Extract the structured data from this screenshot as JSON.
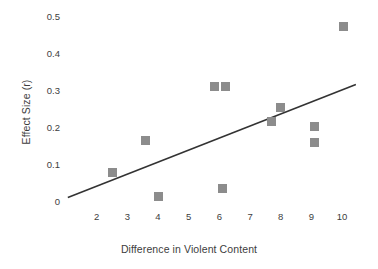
{
  "chart_data": {
    "type": "scatter",
    "title": "",
    "xlabel": "Difference in Violent Content",
    "ylabel": "Effect Size (r)",
    "xlim": [
      1.0,
      10.65
    ],
    "ylim": [
      -0.012,
      0.52
    ],
    "xticks": [
      2,
      3,
      4,
      5,
      6,
      7,
      8,
      9,
      10
    ],
    "xtick_labels": [
      "2",
      "3",
      "4",
      "5",
      "6",
      "7",
      "8",
      "9",
      "10"
    ],
    "yticks": [
      0,
      0.1,
      0.2,
      0.3,
      0.4,
      0.5
    ],
    "ytick_labels": [
      "0",
      "0.1",
      "0.2",
      "0.3",
      "0.4",
      "0.5"
    ],
    "grid": false,
    "legend": "none",
    "marker_shape": "square",
    "marker_color": "#8c8c8c",
    "marker_size_px": 9,
    "line_color": "#333333",
    "points": [
      {
        "x": 2.5,
        "y": 0.08
      },
      {
        "x": 3.6,
        "y": 0.165
      },
      {
        "x": 4.0,
        "y": 0.015
      },
      {
        "x": 5.85,
        "y": 0.312
      },
      {
        "x": 6.2,
        "y": 0.312
      },
      {
        "x": 6.1,
        "y": 0.035
      },
      {
        "x": 7.7,
        "y": 0.218
      },
      {
        "x": 8.0,
        "y": 0.255
      },
      {
        "x": 9.1,
        "y": 0.205
      },
      {
        "x": 9.1,
        "y": 0.16
      },
      {
        "x": 10.05,
        "y": 0.475
      }
    ],
    "trendline": {
      "x_start": 1.06,
      "y_start": 0.011,
      "x_end": 10.45,
      "y_end": 0.318
    }
  }
}
